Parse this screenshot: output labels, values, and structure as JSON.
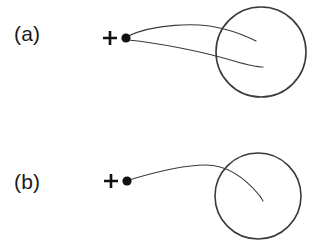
{
  "figure": {
    "width": 323,
    "height": 248,
    "background_color": "#ffffff",
    "panels": [
      {
        "id": "a",
        "label": "(a)",
        "label_x": 14,
        "label_y": 22,
        "description": "Two curved trajectories emanating from a point source, converging into and terminating inside a circle",
        "source_marker": {
          "plus_x": 110,
          "plus_y": 38,
          "plus_size": 13,
          "dot_x": 126,
          "dot_y": 38,
          "dot_radius": 4.6,
          "color": "#111111"
        },
        "circle": {
          "cx": 261,
          "cy": 52,
          "r": 45,
          "stroke_color": "#3a3a3a",
          "stroke_width": 1.6
        },
        "curves": [
          {
            "name": "upper-trajectory",
            "stroke_color": "#3a3a3a",
            "path": "M 128 36 C 152 25, 196 21, 224 29 C 240 33, 250 38, 256 41"
          },
          {
            "name": "lower-trajectory",
            "stroke_color": "#3a3a3a",
            "path": "M 128 40 C 160 43, 204 52, 234 61 C 248 65, 257 67, 263 67"
          }
        ]
      },
      {
        "id": "b",
        "label": "(b)",
        "label_x": 14,
        "label_y": 22,
        "description": "A single curved trajectory from a point source arcing over and terminating inside a circle",
        "source_marker": {
          "plus_x": 111,
          "plus_y": 57,
          "plus_size": 13,
          "dot_x": 127,
          "dot_y": 57,
          "dot_radius": 4.6,
          "color": "#111111"
        },
        "circle": {
          "cx": 258,
          "cy": 72,
          "r": 43,
          "stroke_color": "#3a3a3a",
          "stroke_width": 1.6
        },
        "curves": [
          {
            "name": "single-trajectory",
            "stroke_color": "#3a3a3a",
            "path": "M 129 56 C 152 49, 182 41, 206 41 C 228 41, 246 55, 260 72 C 261 74, 262 75, 263 77"
          }
        ]
      }
    ]
  }
}
